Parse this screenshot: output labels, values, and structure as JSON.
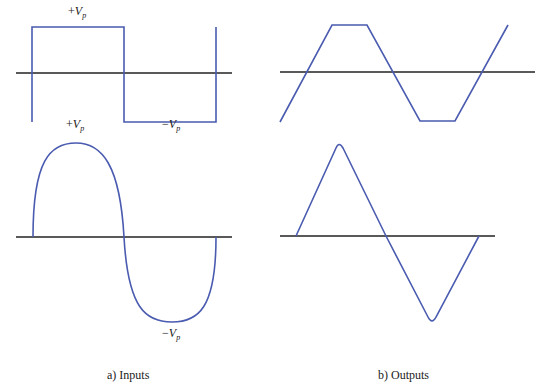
{
  "figure": {
    "colors": {
      "waveform": "#4a5bb0",
      "axis": "#222222",
      "background": "#ffffff"
    },
    "panels": [
      {
        "id": "input-square",
        "group": "inputs",
        "waveform": "square",
        "axis": {
          "x1": 16,
          "x2": 232,
          "y": 73
        },
        "path": "M32,122 L32,27 L124,27 L124,122 L216,122 L216,27"
      },
      {
        "id": "output-trapezoid",
        "group": "outputs",
        "waveform": "clipped-triangle (trapezoidal)",
        "axis": {
          "x1": 280,
          "x2": 535,
          "y": 72
        },
        "path": "M280,122 L332,25 L367,25 L420,121 L455,121 L508,25"
      },
      {
        "id": "input-sine",
        "group": "inputs",
        "waveform": "sine",
        "axis": {
          "x1": 16,
          "x2": 232,
          "y": 237
        },
        "path": "M33,237 C33,160 50,143 76,143 C102,143 120,165 124,237 C128,309 146,322 172,322 C198,322 216,309 216,237"
      },
      {
        "id": "output-triangle",
        "group": "outputs",
        "waveform": "triangle",
        "axis": {
          "x1": 280,
          "x2": 495,
          "y": 236
        },
        "path": "M296,236 L336,148 Q339,141 343,148 L386,236 L428,317 Q432,325 436,317 L479,236"
      }
    ],
    "labels": {
      "square_pos": {
        "sign": "+",
        "v": "V",
        "sub": "p"
      },
      "square_neg": {
        "sign": "−",
        "v": "V",
        "sub": "p"
      },
      "sine_pos": {
        "sign": "+",
        "v": "V",
        "sub": "p"
      },
      "sine_neg": {
        "sign": "−",
        "v": "V",
        "sub": "p"
      }
    },
    "captions": {
      "inputs": "a) Inputs",
      "outputs": "b) Outputs"
    }
  }
}
